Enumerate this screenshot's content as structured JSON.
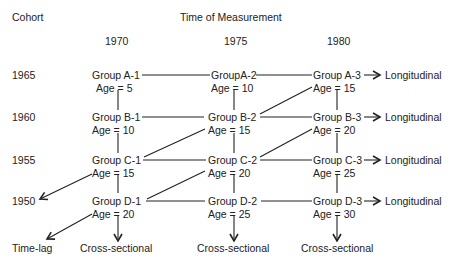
{
  "header": {
    "cohort_label": "Cohort",
    "time_label": "Time of Measurement",
    "years": [
      "1970",
      "1975",
      "1980"
    ]
  },
  "cohorts": [
    "1965",
    "1960",
    "1955",
    "1950"
  ],
  "groups": {
    "A": [
      {
        "label": "Group A-1",
        "age": "Age = 5"
      },
      {
        "label": "GroupA-2",
        "age": "Age = 10"
      },
      {
        "label": "Group A-3",
        "age": "Age = 15"
      }
    ],
    "B": [
      {
        "label": "Group B-1",
        "age": "Age = 10"
      },
      {
        "label": "Group B-2",
        "age": "Age = 15"
      },
      {
        "label": "Group B-3",
        "age": "Age = 20"
      }
    ],
    "C": [
      {
        "label": "Group C-1",
        "age": "Age = 15"
      },
      {
        "label": "Group C-2",
        "age": "Age = 20"
      },
      {
        "label": "Group C-3",
        "age": "Age = 25"
      }
    ],
    "D": [
      {
        "label": "Group D-1",
        "age": "Age = 20"
      },
      {
        "label": "Group D-2",
        "age": "Age = 25"
      },
      {
        "label": "Group D-3",
        "age": "Age = 30"
      }
    ]
  },
  "labels": {
    "longitudinal": "Longitudinal",
    "cross_sectional": "Cross-sectional",
    "time_lag": "Time-lag"
  },
  "colors": {
    "ink": "#222222",
    "background": "#ffffff"
  }
}
